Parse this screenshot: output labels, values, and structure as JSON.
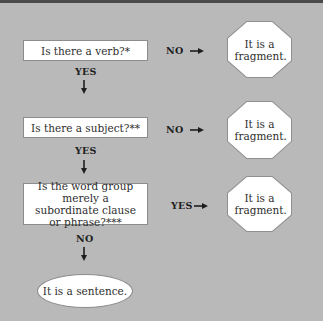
{
  "diagram": {
    "type": "flowchart",
    "title": "",
    "questions": [
      {
        "id": "q1",
        "text": "Is there a verb?*"
      },
      {
        "id": "q2",
        "text": "Is there a subject?**"
      },
      {
        "id": "q3",
        "text": "Is the word group merely a subordinate clause or phrase?***"
      }
    ],
    "outcomes": {
      "fragment_1": "It is a fragment.",
      "fragment_2": "It is a fragment.",
      "fragment_3": "It is a fragment.",
      "sentence": "It is a sentence."
    },
    "edges": [
      {
        "from": "q1",
        "to": "fragment_1",
        "label": "NO"
      },
      {
        "from": "q1",
        "to": "q2",
        "label": "YES"
      },
      {
        "from": "q2",
        "to": "fragment_2",
        "label": "NO"
      },
      {
        "from": "q2",
        "to": "q3",
        "label": "YES"
      },
      {
        "from": "q3",
        "to": "fragment_3",
        "label": "YES"
      },
      {
        "from": "q3",
        "to": "sentence",
        "label": "NO"
      }
    ],
    "colors": {
      "background": "#b9b9b9",
      "box_fill": "#ffffff",
      "box_border": "#8c8c8c",
      "text": "#2e2e2e"
    }
  }
}
